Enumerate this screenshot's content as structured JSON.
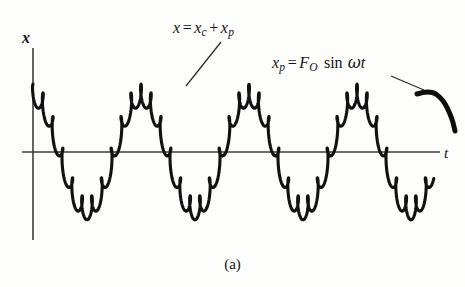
{
  "figure": {
    "caption": "(a)",
    "background_color": "#fdfdfc",
    "ink_color": "#111111",
    "axis_color": "#3a3a3a"
  },
  "axes": {
    "y_label": "x",
    "x_label": "t",
    "origin_px": {
      "x": 33,
      "y": 152
    },
    "y_axis_top_px": 48,
    "y_axis_bottom_px": 240,
    "x_axis_right_px": 440
  },
  "annotations": [
    {
      "name": "total-response-label",
      "parts": {
        "lhs": "x",
        "eq": "=",
        "term1_base": "x",
        "term1_sub": "c",
        "plus": "+",
        "term2_base": "x",
        "term2_sub": "p"
      },
      "text": "x = x_c + x_p",
      "leader": {
        "from_x": 186,
        "from_y": 86,
        "to_x": 221,
        "to_y": 42
      }
    },
    {
      "name": "particular-solution-label",
      "parts": {
        "lhs_base": "x",
        "lhs_sub": "p",
        "eq": "=",
        "amp_base": "F",
        "amp_sub": "O",
        "fn": "sin",
        "omega": "ω",
        "var": "t"
      },
      "text": "x_p = F_O sin ωt",
      "leader": {
        "from_x": 391,
        "from_y": 76,
        "to_x": 424,
        "to_y": 90
      }
    }
  ],
  "chart_data": {
    "type": "line",
    "title": "",
    "subtitle": "",
    "xlabel": "t",
    "ylabel": "x",
    "grid": false,
    "legend": null,
    "axis_ranges": {
      "x": [
        0,
        3.6
      ],
      "y": [
        -1.35,
        1.35
      ]
    },
    "series": [
      {
        "name": "x = x_c + x_p (combined trochoidal response)",
        "kind": "parametric-trochoid",
        "stroke_width_px": 3.2,
        "color": "#111111",
        "slow_component": {
          "label": "x_c",
          "amplitude": 1.0,
          "cycles_visible": 3.5,
          "period_px": 108,
          "phase_deg": 90,
          "start_px_x": 33
        },
        "fast_component": {
          "label": "x_p",
          "amplitude": 0.19,
          "cycles_per_slow_cycle": 11,
          "loop_radius_x": 0.022,
          "creates_loops": true
        },
        "x_start_px": 33,
        "x_end_px": 432
      },
      {
        "name": "x_p = F_O sin ωt (smooth arc)",
        "kind": "arc",
        "stroke_width_px": 5.0,
        "color": "#0d0d0d",
        "points_px": [
          {
            "x": 417,
            "y": 94
          },
          {
            "x": 430,
            "y": 90
          },
          {
            "x": 443,
            "y": 99
          },
          {
            "x": 452,
            "y": 118
          },
          {
            "x": 455,
            "y": 131
          }
        ]
      }
    ],
    "peaks_px": [
      {
        "x": 33,
        "y": 95
      },
      {
        "x": 141,
        "y": 95
      },
      {
        "x": 249,
        "y": 95
      },
      {
        "x": 357,
        "y": 95
      }
    ],
    "troughs_px": [
      {
        "x": 87,
        "y": 209
      },
      {
        "x": 195,
        "y": 209
      },
      {
        "x": 303,
        "y": 209
      },
      {
        "x": 411,
        "y": 209
      }
    ],
    "zero_crossings_px": [
      60,
      114,
      168,
      222,
      276,
      330,
      384
    ]
  }
}
